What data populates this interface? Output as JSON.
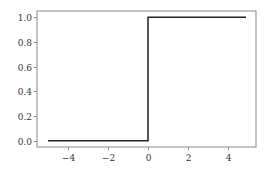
{
  "chart_data": {
    "type": "line",
    "title": "",
    "xlabel": "",
    "ylabel": "",
    "xlim": [
      -5.55,
      5.4
    ],
    "ylim": [
      -0.05,
      1.05
    ],
    "grid": false,
    "legend": null,
    "xticks": [
      -4,
      -2,
      0,
      2,
      4
    ],
    "xtick_labels": [
      "−4",
      "−2",
      "0",
      "2",
      "4"
    ],
    "yticks": [
      0.0,
      0.2,
      0.4,
      0.6,
      0.8,
      1.0
    ],
    "ytick_labels": [
      "0.0",
      "0.2",
      "0.4",
      "0.6",
      "0.8",
      "1.0"
    ],
    "series": [
      {
        "name": "step",
        "color": "#222222",
        "x": [
          -5,
          0,
          0,
          4.9
        ],
        "y": [
          0,
          0,
          1,
          1
        ]
      }
    ]
  },
  "style": {
    "frame_color": "#888888",
    "line_color": "#222222"
  }
}
